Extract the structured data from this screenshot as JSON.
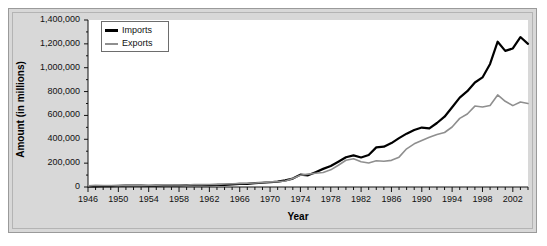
{
  "chart_data": {
    "type": "line",
    "title": "",
    "xlabel": "Year",
    "ylabel": "Amount (in millions)",
    "xlim": [
      1946,
      2004
    ],
    "ylim": [
      0,
      1400000
    ],
    "grid": false,
    "legend_position": "top-left",
    "y_ticks": [
      0,
      200000,
      400000,
      600000,
      800000,
      1000000,
      1200000,
      1400000
    ],
    "y_tick_labels": [
      "0",
      "200,000",
      "400,000",
      "600,000",
      "800,000",
      "1,000,000",
      "1,200,000",
      "1,400,000"
    ],
    "x_ticks": [
      1946,
      1950,
      1954,
      1958,
      1962,
      1966,
      1970,
      1974,
      1978,
      1982,
      1986,
      1990,
      1994,
      1998,
      2002
    ],
    "x_tick_labels": [
      "1946",
      "1950",
      "1954",
      "1958",
      "1962",
      "1966",
      "1970",
      "1974",
      "1978",
      "1982",
      "1986",
      "1990",
      "1994",
      "1998",
      "2002"
    ],
    "x_minor_tick_step": 1,
    "x": [
      1946,
      1947,
      1948,
      1949,
      1950,
      1951,
      1952,
      1953,
      1954,
      1955,
      1956,
      1957,
      1958,
      1959,
      1960,
      1961,
      1962,
      1963,
      1964,
      1965,
      1966,
      1967,
      1968,
      1969,
      1970,
      1971,
      1972,
      1973,
      1974,
      1975,
      1976,
      1977,
      1978,
      1979,
      1980,
      1981,
      1982,
      1983,
      1984,
      1985,
      1986,
      1987,
      1988,
      1989,
      1990,
      1991,
      1992,
      1993,
      1994,
      1995,
      1996,
      1997,
      1998,
      1999,
      2000,
      2001,
      2002,
      2003,
      2004
    ],
    "series": [
      {
        "name": "Imports",
        "color": "#000000",
        "line_width": 2.2,
        "values": [
          4900,
          5700,
          7100,
          6600,
          8850,
          11000,
          10700,
          10900,
          10200,
          11400,
          12600,
          13200,
          12700,
          15200,
          14650,
          14500,
          16200,
          17000,
          18600,
          21300,
          25500,
          26800,
          32900,
          35800,
          39900,
          45500,
          55800,
          70500,
          103800,
          98200,
          124200,
          151900,
          176000,
          212000,
          249700,
          265000,
          247600,
          268900,
          332400,
          338100,
          368400,
          409800,
          447200,
          477400,
          498300,
          490900,
          536500,
          589400,
          668600,
          749400,
          803100,
          876400,
          918600,
          1031800,
          1218000,
          1141000,
          1161400,
          1257100,
          1200200
        ]
      },
      {
        "name": "Exports",
        "color": "#8f8f8f",
        "line_width": 1.6,
        "values": [
          9700,
          14400,
          12700,
          12000,
          10200,
          14200,
          13300,
          12300,
          12800,
          14300,
          17400,
          19400,
          16300,
          16300,
          19600,
          20200,
          20900,
          22400,
          25700,
          26700,
          29500,
          31000,
          34100,
          37300,
          42700,
          43500,
          49800,
          71400,
          98500,
          107700,
          115000,
          121200,
          143800,
          182000,
          224300,
          237000,
          211200,
          201800,
          219900,
          215900,
          223300,
          250300,
          320200,
          362100,
          389300,
          416900,
          440400,
          456900,
          502900,
          575200,
          612100,
          678400,
          670400,
          684000,
          772000,
          718700,
          682400,
          713100,
          700000
        ]
      }
    ]
  },
  "legend": {
    "items": [
      {
        "label": "Imports"
      },
      {
        "label": "Exports"
      }
    ]
  },
  "axes": {
    "y_title": "Amount (in millions)",
    "x_title": "Year"
  }
}
